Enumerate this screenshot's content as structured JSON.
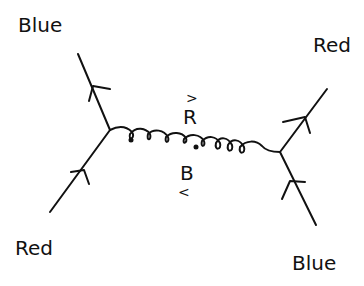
{
  "diagram": {
    "type": "feynman-diagram",
    "ink_color": "#111111",
    "background": "#ffffff",
    "labels": {
      "top_left": "Blue",
      "top_right": "Red",
      "bottom_left": "Red",
      "bottom_right": "Blue"
    },
    "gluon": {
      "upper_label": "R",
      "upper_arrow": ">",
      "lower_label": "B",
      "lower_arrow": "<"
    },
    "lines": [
      {
        "name": "incoming-red-quark",
        "from": "bottom-left",
        "to": "left-vertex",
        "arrow": "toward-vertex"
      },
      {
        "name": "outgoing-blue-quark",
        "from": "left-vertex",
        "to": "top-left",
        "arrow": "away-from-vertex"
      },
      {
        "name": "incoming-blue-quark",
        "from": "bottom-right",
        "to": "right-vertex",
        "arrow": "toward-vertex"
      },
      {
        "name": "outgoing-red-quark",
        "from": "right-vertex",
        "to": "top-right",
        "arrow": "away-from-vertex"
      },
      {
        "name": "gluon",
        "from": "left-vertex",
        "to": "right-vertex",
        "style": "curly"
      }
    ]
  }
}
